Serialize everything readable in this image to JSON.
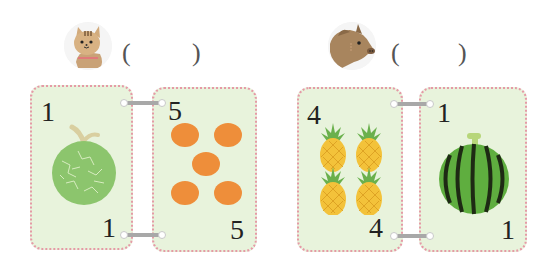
{
  "header": {
    "left_animal": "cat-icon",
    "right_animal": "boar-icon",
    "left_answer": {
      "open": "(",
      "close": ")",
      "value": ""
    },
    "right_answer": {
      "open": "(",
      "close": ")",
      "value": ""
    }
  },
  "cards": [
    {
      "top_number": "1",
      "bottom_number": "1",
      "fruit": "melon-icon",
      "count": 1
    },
    {
      "top_number": "5",
      "bottom_number": "5",
      "fruit": "orange-icon",
      "count": 5
    },
    {
      "top_number": "4",
      "bottom_number": "4",
      "fruit": "pineapple-icon",
      "count": 4
    },
    {
      "top_number": "1",
      "bottom_number": "1",
      "fruit": "watermelon-icon",
      "count": 1
    }
  ],
  "colors": {
    "card_bg": "#e8f3dc",
    "card_border": "#e59aa6",
    "melon": "#8cc56d",
    "orange": "#ee8e3a",
    "pineapple": "#f3c23a",
    "leaf": "#6ab04c",
    "watermelon": "#4e9a3a"
  }
}
